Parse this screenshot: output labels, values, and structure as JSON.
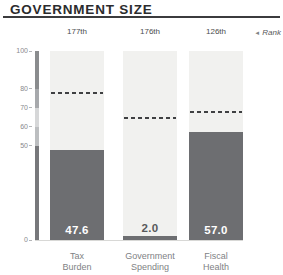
{
  "header": {
    "title": "GOVERNMENT SIZE"
  },
  "rank_legend": {
    "arrow_icon": "◄",
    "label": "Rank"
  },
  "chart_data": {
    "type": "bar",
    "title": "GOVERNMENT SIZE",
    "ylabel": "",
    "xlabel": "",
    "ylim": [
      0,
      100
    ],
    "yticks": [
      0,
      50,
      60,
      70,
      80,
      100
    ],
    "ytick_labels": [
      "0",
      "50",
      "60",
      "70",
      "80",
      "100"
    ],
    "grid": false,
    "legend_position": "none",
    "categories": [
      "Tax Burden",
      "Government Spending",
      "Fiscal Health"
    ],
    "values": [
      47.6,
      2.0,
      57.0
    ],
    "columns": [
      {
        "label_line1": "Tax",
        "label_line2": "Burden",
        "value": 47.6,
        "value_label": "47.6",
        "rank": "177th",
        "world_average_dashed": 77
      },
      {
        "label_line1": "Government",
        "label_line2": "Spending",
        "value": 2.0,
        "value_label": "2.0",
        "rank": "176th",
        "world_average_dashed": 64
      },
      {
        "label_line1": "Fiscal",
        "label_line2": "Health",
        "value": 57.0,
        "value_label": "57.0",
        "rank": "126th",
        "world_average_dashed": 67
      }
    ]
  },
  "colors": {
    "title": "#2b2b2d",
    "title_rule": "#3b3b3d",
    "rank_text": "#4b4c4e",
    "column_bg": "#f1f1ef",
    "bar_fill": "#6d6e71",
    "value_in_bar": "#ffffff",
    "value_outside": "#58595b",
    "dashed_line": "#3f4042",
    "axis_labels": "#88898c",
    "category_labels": "#808285",
    "baseline": "#d8d8d6",
    "axis_segments": [
      "#8a8c8e",
      "#a7a9ac",
      "#d6d7d8",
      "#bcbec0",
      "#77787b"
    ]
  }
}
